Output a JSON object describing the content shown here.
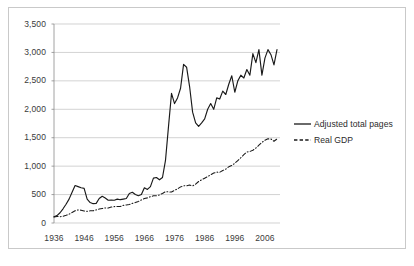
{
  "chart_data": {
    "type": "line",
    "title": "",
    "subtitle": "",
    "xlabel": "",
    "ylabel": "",
    "xlim": [
      1936,
      2011
    ],
    "ylim": [
      0,
      3500
    ],
    "grid": true,
    "grid_axis": "y",
    "legend_position": "right",
    "x_tick_labels": [
      "1936",
      "1946",
      "1956",
      "1966",
      "1976",
      "1986",
      "1996",
      "2006"
    ],
    "x_ticks": [
      1936,
      1946,
      1956,
      1966,
      1976,
      1986,
      1996,
      2006
    ],
    "y_tick_labels": [
      "0",
      "500",
      "1,000",
      "1,500",
      "2,000",
      "2,500",
      "3,000",
      "3,500"
    ],
    "y_ticks": [
      0,
      500,
      1000,
      1500,
      2000,
      2500,
      3000,
      3500
    ],
    "series": [
      {
        "name": "Adjusted total pages",
        "style": "solid",
        "color": "#1a1a1a",
        "x": [
          1936,
          1937,
          1938,
          1939,
          1940,
          1941,
          1942,
          1943,
          1944,
          1945,
          1946,
          1947,
          1948,
          1949,
          1950,
          1951,
          1952,
          1953,
          1954,
          1955,
          1956,
          1957,
          1958,
          1959,
          1960,
          1961,
          1962,
          1963,
          1964,
          1965,
          1966,
          1967,
          1968,
          1969,
          1970,
          1971,
          1972,
          1973,
          1974,
          1975,
          1976,
          1977,
          1978,
          1979,
          1980,
          1981,
          1982,
          1983,
          1984,
          1985,
          1986,
          1987,
          1988,
          1989,
          1990,
          1991,
          1992,
          1993,
          1994,
          1995,
          1996,
          1997,
          1998,
          1999,
          2000,
          2001,
          2002,
          2003,
          2004,
          2005,
          2006,
          2007,
          2008,
          2009,
          2010
        ],
        "values": [
          110,
          130,
          180,
          250,
          330,
          420,
          540,
          660,
          640,
          620,
          610,
          420,
          360,
          340,
          345,
          430,
          470,
          440,
          400,
          405,
          400,
          420,
          410,
          420,
          430,
          520,
          540,
          500,
          480,
          500,
          620,
          590,
          640,
          790,
          800,
          760,
          800,
          1100,
          1700,
          2280,
          2100,
          2200,
          2370,
          2790,
          2740,
          2400,
          1950,
          1760,
          1700,
          1760,
          1830,
          2000,
          2100,
          2000,
          2200,
          2180,
          2320,
          2260,
          2440,
          2590,
          2300,
          2500,
          2600,
          2550,
          2700,
          2600,
          2980,
          2820,
          3050,
          2600,
          2900,
          3050,
          2960,
          2780,
          3050
        ]
      },
      {
        "name": "Real GDP",
        "style": "dash-dot",
        "color": "#1a1a1a",
        "x": [
          1936,
          1937,
          1938,
          1939,
          1940,
          1941,
          1942,
          1943,
          1944,
          1945,
          1946,
          1947,
          1948,
          1949,
          1950,
          1951,
          1952,
          1953,
          1954,
          1955,
          1956,
          1957,
          1958,
          1959,
          1960,
          1961,
          1962,
          1963,
          1964,
          1965,
          1966,
          1967,
          1968,
          1969,
          1970,
          1971,
          1972,
          1973,
          1974,
          1975,
          1976,
          1977,
          1978,
          1979,
          1980,
          1981,
          1982,
          1983,
          1984,
          1985,
          1986,
          1987,
          1988,
          1989,
          1990,
          1991,
          1992,
          1993,
          1994,
          1995,
          1996,
          1997,
          1998,
          1999,
          2000,
          2001,
          2002,
          2003,
          2004,
          2005,
          2006,
          2007,
          2008,
          2009,
          2010
        ],
        "values": [
          105,
          115,
          110,
          120,
          135,
          155,
          185,
          215,
          230,
          225,
          210,
          205,
          215,
          215,
          230,
          245,
          255,
          265,
          262,
          280,
          288,
          292,
          290,
          310,
          318,
          325,
          345,
          360,
          380,
          405,
          430,
          442,
          462,
          478,
          478,
          495,
          520,
          550,
          548,
          545,
          575,
          600,
          635,
          655,
          652,
          668,
          652,
          682,
          730,
          760,
          788,
          815,
          848,
          878,
          895,
          892,
          922,
          948,
          988,
          1012,
          1050,
          1098,
          1148,
          1202,
          1248,
          1258,
          1280,
          1318,
          1368,
          1418,
          1455,
          1480,
          1478,
          1438,
          1478
        ]
      }
    ]
  },
  "legend": {
    "items": [
      {
        "label": "Adjusted total pages",
        "style": "solid"
      },
      {
        "label": "Real GDP",
        "style": "dashed"
      }
    ]
  }
}
